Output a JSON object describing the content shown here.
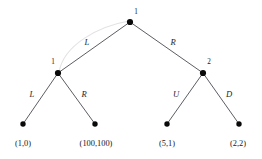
{
  "figure": {
    "type": "game-tree",
    "background_color": "#ffffff",
    "node_color": "#0a0a0a",
    "edge_color": "#4a4a52",
    "info_set_color": "#e2e2e4"
  },
  "nodes": [
    {
      "id": "root",
      "player": "1",
      "x": 130,
      "y": 22,
      "label_x": 136,
      "label_y": 14
    },
    {
      "id": "left",
      "player": "1",
      "x": 58,
      "y": 73,
      "label_x": 53,
      "label_y": 64
    },
    {
      "id": "right",
      "player": "2",
      "x": 203,
      "y": 73,
      "label_x": 209,
      "label_y": 64
    },
    {
      "id": "leaf1",
      "player": "",
      "x": 23,
      "y": 124,
      "label_x": 0,
      "label_y": 0
    },
    {
      "id": "leaf2",
      "player": "",
      "x": 95,
      "y": 124,
      "label_x": 0,
      "label_y": 0
    },
    {
      "id": "leaf3",
      "player": "",
      "x": 167,
      "y": 124,
      "label_x": 0,
      "label_y": 0
    },
    {
      "id": "leaf4",
      "player": "",
      "x": 239,
      "y": 124,
      "label_x": 0,
      "label_y": 0
    }
  ],
  "edges": [
    {
      "id": "root-left",
      "from": "root",
      "to": "leftnode",
      "x1": 130,
      "y1": 22,
      "x2": 58,
      "y2": 73,
      "action": "L",
      "label_x": 87,
      "label_y": 45
    },
    {
      "id": "root-right",
      "from": "root",
      "to": "rightnode",
      "x1": 130,
      "y1": 22,
      "x2": 203,
      "y2": 73,
      "action": "R",
      "label_x": 173,
      "label_y": 45
    },
    {
      "id": "left-leaf1",
      "from": "left",
      "to": "leaf1",
      "x1": 58,
      "y1": 73,
      "x2": 23,
      "y2": 124,
      "action": "L",
      "label_x": 32,
      "label_y": 97
    },
    {
      "id": "left-leaf2",
      "from": "left",
      "to": "leaf2",
      "x1": 58,
      "y1": 73,
      "x2": 95,
      "y2": 124,
      "action": "R",
      "label_x": 84,
      "label_y": 97
    },
    {
      "id": "right-leaf3",
      "from": "right",
      "to": "leaf3",
      "x1": 203,
      "y1": 73,
      "x2": 167,
      "y2": 124,
      "action": "U",
      "label_x": 176,
      "label_y": 97
    },
    {
      "id": "right-leaf4",
      "from": "right",
      "to": "leaf4",
      "x1": 203,
      "y1": 73,
      "x2": 239,
      "y2": 124,
      "action": "D",
      "label_x": 229,
      "label_y": 97
    }
  ],
  "information_set": {
    "id": "info-set-player1",
    "connects": [
      "root",
      "left"
    ],
    "path": "M 59 72 C 64 44, 100 26, 129 21"
  },
  "payoffs": [
    {
      "id": "payoff-1",
      "text": "(1,0)",
      "x": 23,
      "y": 146
    },
    {
      "id": "payoff-2",
      "text": "(100,100)",
      "x": 96,
      "y": 146
    },
    {
      "id": "payoff-3",
      "text": "(5,1)",
      "x": 167,
      "y": 146
    },
    {
      "id": "payoff-4",
      "text": "(2,2)",
      "x": 238,
      "y": 146
    }
  ]
}
